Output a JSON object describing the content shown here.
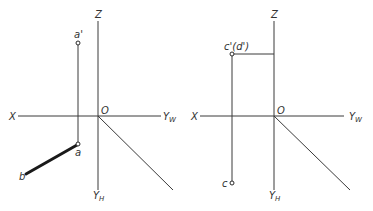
{
  "diagrams": [
    {
      "name": "left-projection",
      "axis_labels": {
        "z": "Z",
        "x": "X",
        "origin": "O",
        "yw": "Y",
        "yw_sub": "W",
        "yh": "Y",
        "yh_sub": "H"
      },
      "points": {
        "a_prime": "a'",
        "a": "a",
        "b": "b"
      }
    },
    {
      "name": "right-projection",
      "axis_labels": {
        "z": "Z",
        "x": "X",
        "origin": "O",
        "yw": "Y",
        "yw_sub": "W",
        "yh": "Y",
        "yh_sub": "H"
      },
      "points": {
        "c_prime_d_prime": "c'(d')",
        "c": "c"
      }
    }
  ]
}
